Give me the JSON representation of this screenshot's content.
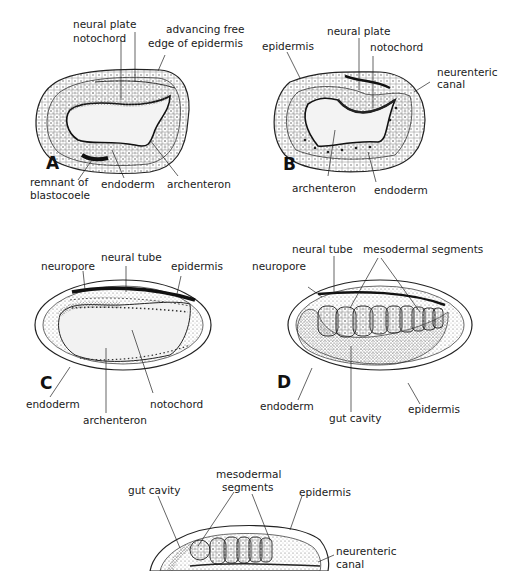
{
  "figure": {
    "panels": [
      {
        "id": "A",
        "letter": "A",
        "labels": {
          "neural_plate": "neural plate",
          "notochord": "notochord",
          "advancing_free_1": "advancing free",
          "advancing_free_2": "edge of epidermis",
          "remnant_1": "remnant of",
          "remnant_2": "blastocoele",
          "endoderm": "endoderm",
          "archenteron": "archenteron"
        }
      },
      {
        "id": "B",
        "letter": "B",
        "labels": {
          "epidermis": "epidermis",
          "neural_plate": "neural plate",
          "notochord": "notochord",
          "neurenteric_1": "neurenteric",
          "neurenteric_2": "canal",
          "archenteron": "archenteron",
          "endoderm": "endoderm"
        }
      },
      {
        "id": "C",
        "letter": "C",
        "labels": {
          "neuropore": "neuropore",
          "neural_tube": "neural tube",
          "epidermis": "epidermis",
          "endoderm": "endoderm",
          "archenteron": "archenteron",
          "notochord": "notochord"
        }
      },
      {
        "id": "D",
        "letter": "D",
        "labels": {
          "neuropore": "neuropore",
          "neural_tube": "neural tube",
          "mesodermal_segments": "mesodermal segments",
          "endoderm": "endoderm",
          "gut_cavity": "gut cavity",
          "epidermis": "epidermis"
        }
      },
      {
        "id": "E",
        "letter": "",
        "labels": {
          "gut_cavity": "gut cavity",
          "mesodermal_1": "mesodermal",
          "mesodermal_2": "segments",
          "epidermis": "epidermis",
          "neurenteric_1": "neurenteric",
          "neurenteric_2": "canal"
        }
      }
    ],
    "colors": {
      "ink": "#1a1a1a",
      "stipple": "#555555",
      "background": "#ffffff"
    }
  }
}
